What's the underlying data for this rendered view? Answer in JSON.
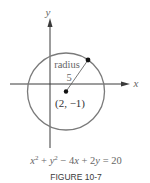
{
  "figure": {
    "caption": "FIGURE 10-7",
    "equation": {
      "part1": "x",
      "sup1": "2",
      "part2": " + ",
      "part3": "y",
      "sup2": "2",
      "part4": " − 4",
      "part5": "x",
      "part6": " + 2",
      "part7": "y",
      "part8": " = 20"
    },
    "axes": {
      "x_label": "x",
      "y_label": "y"
    },
    "circle": {
      "center_label": "(2, −1)",
      "radius_label": "radius",
      "radius_value": "5",
      "stroke_color": "#7a7a7a"
    },
    "colors": {
      "axis": "#3a3a3a",
      "circle": "#7a7a7a",
      "text": "#666666"
    }
  }
}
